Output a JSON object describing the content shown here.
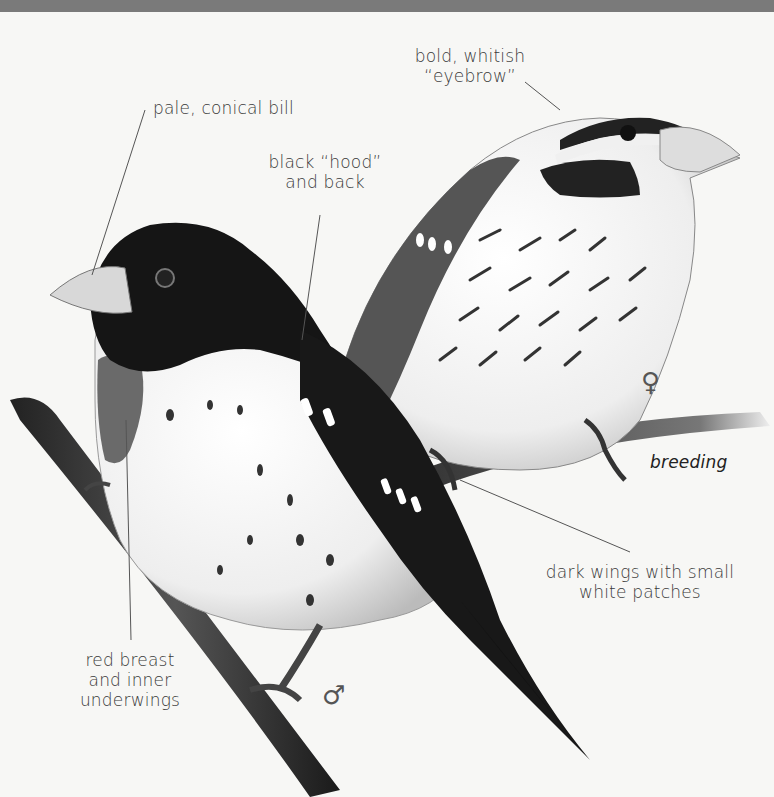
{
  "figure": {
    "labels": {
      "eyebrow_1": "bold, whitish",
      "eyebrow_2": "“eyebrow”",
      "bill": "pale, conical bill",
      "hood_1": "black “hood”",
      "hood_2": "and back",
      "breeding": "breeding",
      "wings_1": "dark wings with small",
      "wings_2": "white patches",
      "breast_1": "red breast",
      "breast_2": "and inner",
      "breast_3": "underwings"
    },
    "symbols": {
      "female": "♀",
      "male": "♂"
    },
    "colors": {
      "background": "#f7f7f5",
      "label_text": "#3a3a3a",
      "leader_line": "#555555",
      "plumage_dark": "#151515"
    }
  }
}
